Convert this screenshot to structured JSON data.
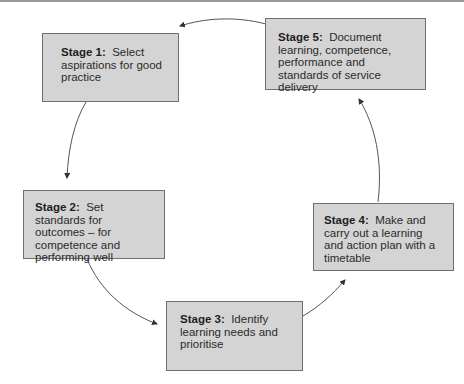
{
  "diagram": {
    "type": "cycle",
    "stages": [
      {
        "label": "Stage 1:",
        "text": "Select aspirations for good practice"
      },
      {
        "label": "Stage 2:",
        "text": "Set standards for outcomes – for competence and performing well"
      },
      {
        "label": "Stage 3:",
        "text": "Identify learning needs and prioritise"
      },
      {
        "label": "Stage 4:",
        "text": "Make and carry out a learning and action plan with a timetable"
      },
      {
        "label": "Stage 5:",
        "text": "Document learning, competence, performance and standards of service delivery"
      }
    ],
    "flow": [
      "Stage 1 → Stage 2",
      "Stage 2 → Stage 3",
      "Stage 3 → Stage 4",
      "Stage 4 → Stage 5",
      "Stage 5 → Stage 1"
    ],
    "colors": {
      "box_fill": "#d4d4d4",
      "box_border": "#6f6f6f",
      "arrow": "#444444",
      "text": "#2b2b2b"
    }
  }
}
